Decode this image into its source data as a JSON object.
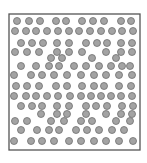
{
  "diagram": {
    "type": "particle-box",
    "box": {
      "x": 9,
      "y": 14,
      "width": 131,
      "height": 136,
      "stroke": "#555555"
    },
    "particle": {
      "radius": 3.5,
      "fill": "#a3a3a3",
      "stroke": "#6e6e6e"
    },
    "rows": [
      {
        "y": 21,
        "x": [
          17,
          29,
          40,
          56,
          66,
          82,
          93,
          104,
          121,
          131
        ]
      },
      {
        "y": 31,
        "x": [
          15,
          26,
          36,
          47,
          58,
          69,
          79,
          90,
          101,
          112,
          122,
          133
        ]
      },
      {
        "y": 43,
        "x": [
          21,
          32,
          43,
          57,
          69,
          86,
          97,
          107,
          121,
          132
        ]
      },
      {
        "y": 52,
        "x": [
          15,
          27,
          39,
          57,
          69,
          82,
          106,
          121,
          132
        ]
      },
      {
        "y": 58,
        "x": [
          51,
          62,
          92,
          116
        ]
      },
      {
        "y": 66,
        "x": [
          21,
          36,
          49,
          59,
          74,
          86,
          99,
          111,
          122,
          130
        ]
      },
      {
        "y": 75,
        "x": [
          14,
          31,
          42,
          54,
          67,
          81,
          94,
          106,
          119,
          132
        ]
      },
      {
        "y": 86,
        "x": [
          16,
          27,
          39,
          56,
          67,
          82,
          94,
          104,
          119,
          131
        ]
      },
      {
        "y": 96,
        "x": [
          14,
          26,
          36,
          47,
          58,
          70,
          81,
          91,
          101,
          111,
          121,
          132
        ]
      },
      {
        "y": 106,
        "x": [
          21,
          32,
          42,
          57,
          69,
          86,
          96,
          107,
          122,
          133
        ]
      },
      {
        "y": 114,
        "x": [
          41,
          57,
          67,
          86,
          106,
          121,
          132
        ]
      },
      {
        "y": 121,
        "x": [
          15,
          27,
          51,
          64,
          81,
          92,
          116,
          130
        ]
      },
      {
        "y": 130,
        "x": [
          21,
          37,
          49,
          59,
          76,
          87,
          99,
          112,
          124
        ]
      },
      {
        "y": 141,
        "x": [
          14,
          31,
          42,
          54,
          69,
          81,
          94,
          106,
          119,
          133
        ]
      }
    ]
  }
}
